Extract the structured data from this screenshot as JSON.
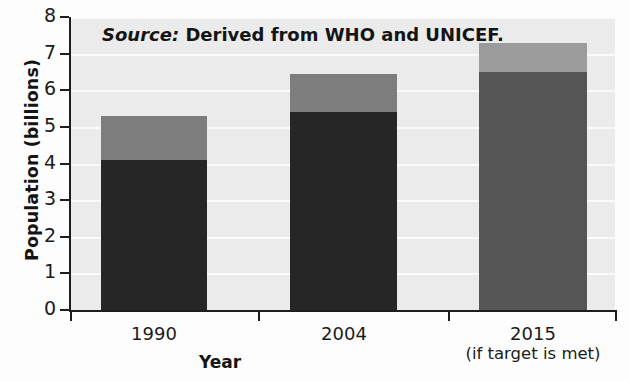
{
  "chart_data": {
    "type": "bar",
    "stacked": true,
    "title": "",
    "xlabel": "Year",
    "ylabel": "Population (billions)",
    "ylim": [
      0,
      8
    ],
    "ytick_values": [
      0,
      1,
      2,
      3,
      4,
      5,
      6,
      7,
      8
    ],
    "ytick_labels": [
      "0",
      "1",
      "2",
      "3",
      "4",
      "5",
      "6",
      "7",
      "8"
    ],
    "grid": true,
    "grid_orientation": "horizontal",
    "legend": "none",
    "categories": [
      "1990",
      "2004",
      "2015"
    ],
    "category_sublabels": [
      "",
      "",
      "(if target is met)"
    ],
    "series": [
      {
        "name": "served-population",
        "values": [
          4.1,
          5.4,
          6.5
        ],
        "colors": [
          "#262626",
          "#262626",
          "#555555"
        ]
      },
      {
        "name": "unserved-population",
        "values": [
          1.2,
          1.05,
          0.8
        ],
        "colors": [
          "#7d7d7d",
          "#7d7d7d",
          "#9b9b9b"
        ]
      }
    ],
    "totals": [
      5.3,
      6.45,
      7.3
    ],
    "annotations": [
      {
        "text_italic": "Source:",
        "text": " Derived from WHO and UNICEF."
      }
    ],
    "colors": {
      "plot_background": "#ebebeb",
      "gridline": "#fafafa",
      "axis": "#1e1e1e",
      "text": "#1b1b1b",
      "dark_segment": "#262626",
      "mid_segment": "#555555",
      "light_segment": "#7d7d7d",
      "lightest_segment": "#9b9b9b"
    }
  }
}
